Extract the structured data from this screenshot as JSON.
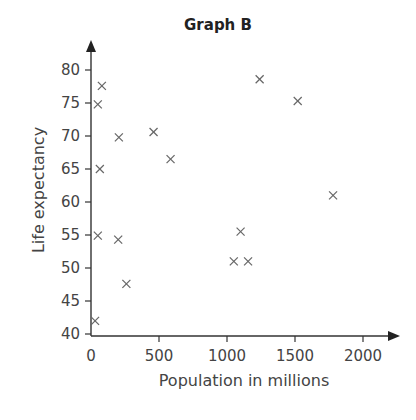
{
  "chart_data": {
    "type": "scatter",
    "title": "Graph B",
    "xlabel": "Population in millions",
    "ylabel": "Life expectancy",
    "xlim": [
      0,
      2200
    ],
    "ylim": [
      40,
      84
    ],
    "x_ticks": [
      0,
      500,
      1000,
      1500,
      2000
    ],
    "y_ticks": [
      40,
      45,
      50,
      55,
      60,
      65,
      70,
      75,
      80
    ],
    "x_tick_labels": [
      "0",
      "500",
      "1000",
      "1500",
      "2000"
    ],
    "y_tick_labels": [
      "40",
      "45",
      "50",
      "55",
      "60",
      "65",
      "70",
      "75",
      "80"
    ],
    "grid": false,
    "legend": null,
    "marker": "x",
    "points": [
      {
        "x": 80,
        "y": 77.6
      },
      {
        "x": 50,
        "y": 74.8
      },
      {
        "x": 205,
        "y": 69.8
      },
      {
        "x": 65,
        "y": 65
      },
      {
        "x": 460,
        "y": 70.6
      },
      {
        "x": 585,
        "y": 66.5
      },
      {
        "x": 1240,
        "y": 78.6
      },
      {
        "x": 1520,
        "y": 75.3
      },
      {
        "x": 1780,
        "y": 61
      },
      {
        "x": 50,
        "y": 54.9
      },
      {
        "x": 200,
        "y": 54.3
      },
      {
        "x": 260,
        "y": 47.6
      },
      {
        "x": 30,
        "y": 42
      },
      {
        "x": 1100,
        "y": 55.5
      },
      {
        "x": 1050,
        "y": 51
      },
      {
        "x": 1155,
        "y": 51
      }
    ]
  }
}
